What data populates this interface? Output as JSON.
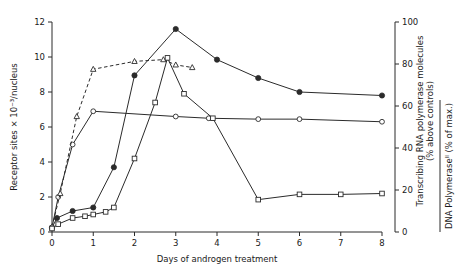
{
  "chart_data": {
    "type": "line",
    "title": "",
    "xlabel": "Days of androgen treatment",
    "ylabel_left": "Receptor sites × 10⁻³/nucleus",
    "ylabel_right_1": "Transcribing RNA polymerase molecules",
    "ylabel_right_1b": "(% above controls)",
    "ylabel_right_2": "DNA Polymeraseᴵᴵ (% of max.)",
    "xlim": [
      0,
      8
    ],
    "ylim_left": [
      0,
      12
    ],
    "ylim_right": [
      0,
      100
    ],
    "grid": false,
    "legend": "none",
    "x_ticks": [
      0,
      1,
      2,
      3,
      4,
      5,
      6,
      7,
      8
    ],
    "x_tick_labels": [
      "0",
      "1",
      "2",
      "3",
      "4",
      "5",
      "6",
      "7",
      "8"
    ],
    "y_ticks_left": [
      0,
      2,
      4,
      6,
      8,
      10,
      12
    ],
    "y_tick_labels_left": [
      "0",
      "2",
      "4",
      "6",
      "8",
      "10",
      "12"
    ],
    "y_ticks_right": [
      0,
      20,
      40,
      60,
      80,
      100
    ],
    "y_tick_labels_right": [
      "0",
      "20",
      "40",
      "60",
      "80",
      "100"
    ],
    "series": [
      {
        "name": "filled-circle-solid",
        "marker": "filled-circle",
        "line": "solid",
        "axis": "left",
        "points": [
          [
            0.0,
            0.25
          ],
          [
            0.12,
            0.8
          ],
          [
            0.5,
            1.2
          ],
          [
            1.0,
            1.4
          ],
          [
            1.5,
            3.7
          ],
          [
            2.0,
            8.95
          ],
          [
            3.0,
            11.6
          ],
          [
            4.0,
            9.85
          ],
          [
            5.0,
            8.8
          ],
          [
            6.0,
            8.0
          ],
          [
            8.0,
            7.8
          ]
        ]
      },
      {
        "name": "open-circle-solid-plateau",
        "marker": "open-circle",
        "line": "solid",
        "axis": "left",
        "points": [
          [
            0.0,
            0.25
          ],
          [
            0.15,
            2.0
          ],
          [
            0.5,
            5.0
          ],
          [
            1.0,
            6.9
          ],
          [
            3.0,
            6.6
          ],
          [
            3.8,
            6.5
          ],
          [
            5.0,
            6.45
          ],
          [
            6.0,
            6.45
          ],
          [
            8.0,
            6.3
          ]
        ]
      },
      {
        "name": "open-triangle-dashed",
        "marker": "open-triangle",
        "line": "dashed",
        "axis": "left",
        "points": [
          [
            0.0,
            0.3
          ],
          [
            0.2,
            2.2
          ],
          [
            0.6,
            6.6
          ],
          [
            1.0,
            9.3
          ],
          [
            2.0,
            9.75
          ],
          [
            2.7,
            9.85
          ],
          [
            3.0,
            9.55
          ],
          [
            3.4,
            9.4
          ]
        ]
      },
      {
        "name": "open-square-solid",
        "marker": "open-square",
        "line": "solid",
        "axis": "left",
        "points": [
          [
            0.0,
            0.2
          ],
          [
            0.15,
            0.45
          ],
          [
            0.5,
            0.8
          ],
          [
            0.8,
            0.9
          ],
          [
            1.0,
            1.0
          ],
          [
            1.3,
            1.15
          ],
          [
            1.5,
            1.4
          ],
          [
            2.0,
            4.2
          ],
          [
            2.5,
            7.4
          ],
          [
            2.8,
            9.95
          ],
          [
            3.2,
            7.9
          ],
          [
            3.9,
            6.5
          ],
          [
            5.0,
            1.85
          ],
          [
            6.0,
            2.15
          ],
          [
            7.0,
            2.15
          ],
          [
            8.0,
            2.2
          ]
        ]
      }
    ]
  }
}
